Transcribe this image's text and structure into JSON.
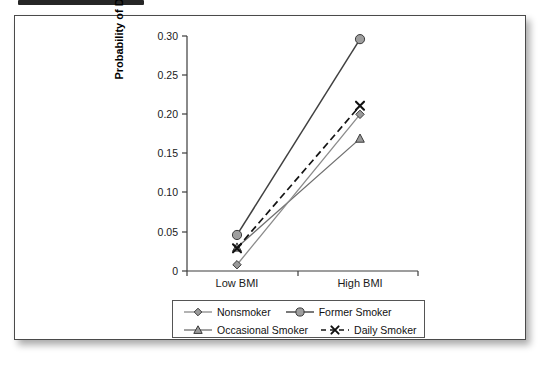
{
  "figure": {
    "top_band_present": true,
    "frame_border_color": "#4a4a4a"
  },
  "chart_data": {
    "type": "line",
    "title": "",
    "xlabel": "",
    "ylabel": "Probability of Diabetes",
    "categories": [
      "Low BMI",
      "High BMI"
    ],
    "ylim": [
      0,
      0.3
    ],
    "yticks": [
      0,
      0.05,
      0.1,
      0.15,
      0.2,
      0.25,
      0.3
    ],
    "ytick_labels": [
      "0",
      "0.05",
      "0.10",
      "0.15",
      "0.20",
      "0.25",
      "0.30"
    ],
    "grid": false,
    "legend_position": "below-axes",
    "series": [
      {
        "name": "Nonsmoker",
        "marker": "diamond",
        "linestyle": "solid",
        "color": "#808080",
        "values": [
          0.008,
          0.2
        ]
      },
      {
        "name": "Former Smoker",
        "marker": "circle",
        "linestyle": "solid",
        "color": "#404040",
        "values": [
          0.046,
          0.296
        ]
      },
      {
        "name": "Occasional Smoker",
        "marker": "triangle",
        "linestyle": "solid",
        "color": "#6e6e6e",
        "values": [
          0.03,
          0.169
        ]
      },
      {
        "name": "Daily Smoker",
        "marker": "x",
        "linestyle": "dashed",
        "color": "#1a1a1a",
        "values": [
          0.029,
          0.211
        ]
      }
    ]
  },
  "axis": {
    "y_title": "Probability of Diabetes",
    "ytick_0": "0",
    "ytick_1": "0.05",
    "ytick_2": "0.10",
    "ytick_3": "0.15",
    "ytick_4": "0.20",
    "ytick_5": "0.25",
    "ytick_6": "0.30",
    "xtick_0": "Low BMI",
    "xtick_1": "High BMI"
  },
  "legend": {
    "items": [
      {
        "label": "Nonsmoker",
        "marker": "diamond",
        "linestyle": "solid"
      },
      {
        "label": "Former Smoker",
        "marker": "circle",
        "linestyle": "solid"
      },
      {
        "label": "Occasional Smoker",
        "marker": "triangle",
        "linestyle": "solid"
      },
      {
        "label": "Daily Smoker",
        "marker": "x",
        "linestyle": "dashed"
      }
    ]
  }
}
